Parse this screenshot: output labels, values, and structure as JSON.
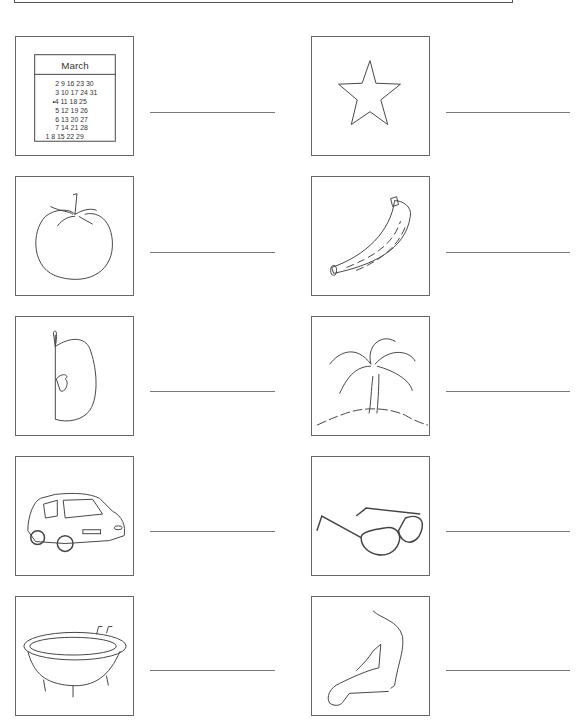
{
  "worksheet": {
    "items": [
      {
        "id": "calendar",
        "label": "",
        "calendar": {
          "month": "March",
          "rows": [
            "2  9 16 23 30",
            "3 10 17 24 31",
            "•4 11 18 25",
            "5 12 19 26",
            "6 13 20 27",
            "7 14 21 28",
            "1  8 15 22 29"
          ]
        }
      },
      {
        "id": "star",
        "label": ""
      },
      {
        "id": "tomato",
        "label": ""
      },
      {
        "id": "banana",
        "label": ""
      },
      {
        "id": "apple-half",
        "label": ""
      },
      {
        "id": "palm-tree",
        "label": ""
      },
      {
        "id": "car",
        "label": ""
      },
      {
        "id": "glasses",
        "label": ""
      },
      {
        "id": "bathtub",
        "label": ""
      },
      {
        "id": "arm",
        "label": ""
      }
    ]
  }
}
